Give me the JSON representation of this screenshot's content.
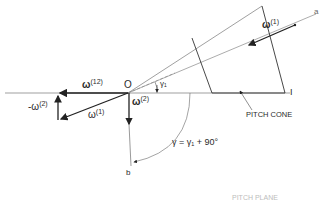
{
  "diagram": {
    "points": {
      "origin": "O",
      "axis_a": "a",
      "axis_b": "b",
      "instant_point": "I"
    },
    "vectors": {
      "omega1_gear": {
        "symbol": "ω",
        "sup": "(1)"
      },
      "omega12": {
        "symbol": "ω",
        "sup": "(12)"
      },
      "omega2": {
        "symbol": "ω",
        "sup": "(2)"
      },
      "neg_omega2": {
        "symbol": "-ω",
        "sup": "(2)"
      },
      "omega1_triangle": {
        "symbol": "ω",
        "sup": "(1)"
      }
    },
    "angles": {
      "gamma1": "γ₁",
      "gamma_equation": "γ = γ₁ + 90°"
    },
    "labels": {
      "pitch_cone": "PITCH CONE",
      "pitch_plane": "PITCH PLANE"
    },
    "colors": {
      "line": "#2a2a2a",
      "thin_line": "#777777"
    }
  }
}
